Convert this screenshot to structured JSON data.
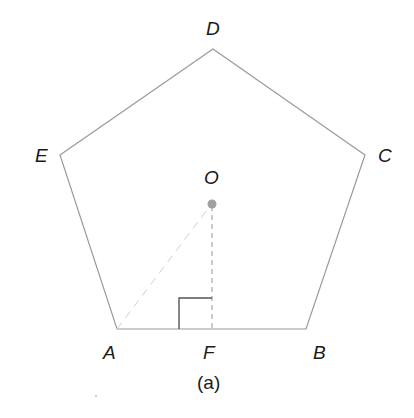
{
  "figure": {
    "caption": "(a)",
    "colors": {
      "edge": "#9a9a9a",
      "dash": "#a8a8a8",
      "center_point": "#a0a0a0",
      "right_angle": "#555555",
      "text": "#1a1a1a"
    },
    "vertices": {
      "A": {
        "label": "A",
        "x": 117,
        "y": 329
      },
      "B": {
        "label": "B",
        "x": 306,
        "y": 329
      },
      "C": {
        "label": "C",
        "x": 365,
        "y": 155
      },
      "D": {
        "label": "D",
        "x": 213,
        "y": 49
      },
      "E": {
        "label": "E",
        "x": 60,
        "y": 155
      }
    },
    "center": {
      "label": "O",
      "x": 212,
      "y": 204
    },
    "foot": {
      "label": "F",
      "x": 212,
      "y": 329
    },
    "segments": [
      "OF dashed",
      "OA faint dashed"
    ],
    "right_angle_marker": "at F"
  }
}
